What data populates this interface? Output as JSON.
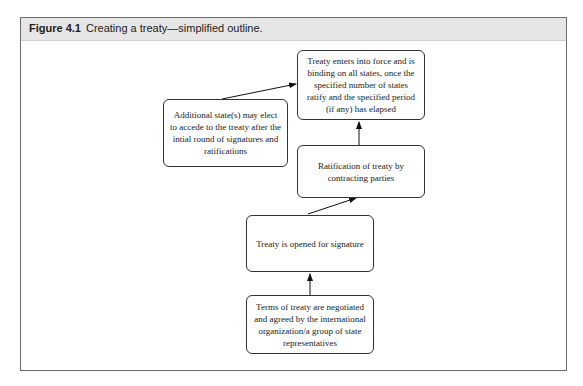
{
  "figure": {
    "label": "Figure 4.1",
    "caption": "Creating a treaty—simplified outline."
  },
  "nodes": {
    "terms": "Terms of treaty are negotiated and agreed by the international organization/a group of state representatives",
    "opened": "Treaty is opened for signature",
    "ratification": "Ratification of treaty by contracting parties",
    "force": "Treaty enters into force and is binding on all states, once the specified number of states ratify and the specified period (if any) has elapsed",
    "additional": "Additional state(s) may elect to accede to the treaty after the intial round of signatures and ratifications"
  },
  "edges": [
    {
      "from": "terms",
      "to": "opened"
    },
    {
      "from": "opened",
      "to": "ratification"
    },
    {
      "from": "ratification",
      "to": "force"
    },
    {
      "from": "additional",
      "to": "force"
    }
  ],
  "colors": {
    "header_bg": "#e6e6e6",
    "frame_border": "#6b6b6b",
    "box_border": "#333333"
  }
}
